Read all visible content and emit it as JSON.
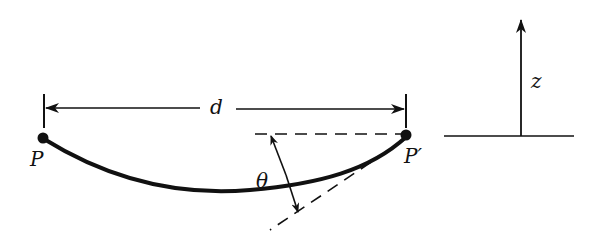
{
  "diagram": {
    "type": "physics-sketch",
    "labels": {
      "distance": "d",
      "left_point": "P",
      "right_point": "P′",
      "angle": "θ",
      "axis": "z"
    },
    "colors": {
      "ink": "#111111",
      "background": "#ffffff"
    }
  }
}
